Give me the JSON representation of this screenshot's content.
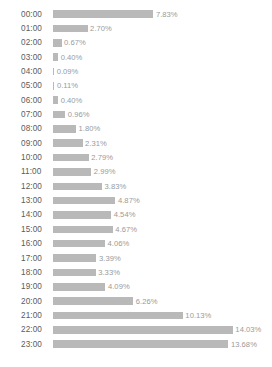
{
  "chart_data": {
    "type": "bar",
    "orientation": "horizontal",
    "title": "",
    "subtitle": "",
    "xlabel": "",
    "ylabel": "",
    "grid": false,
    "legend": null,
    "value_suffix": "%",
    "xlim": [
      0,
      14.03
    ],
    "categories": [
      "00:00",
      "01:00",
      "02:00",
      "03:00",
      "04:00",
      "05:00",
      "06:00",
      "07:00",
      "08:00",
      "09:00",
      "10:00",
      "11:00",
      "12:00",
      "13:00",
      "14:00",
      "15:00",
      "16:00",
      "17:00",
      "18:00",
      "19:00",
      "20:00",
      "21:00",
      "22:00",
      "23:00"
    ],
    "values": [
      7.83,
      2.7,
      0.67,
      0.4,
      0.09,
      0.11,
      0.4,
      0.96,
      1.8,
      2.31,
      2.79,
      2.99,
      3.83,
      4.87,
      4.54,
      4.67,
      4.06,
      3.39,
      3.33,
      4.09,
      6.26,
      10.13,
      14.03,
      13.68
    ],
    "value_labels": [
      "7.83%",
      "2.70%",
      "0.67%",
      "0.40%",
      "0.09%",
      "0.11%",
      "0.40%",
      "0.96%",
      "1.80%",
      "2.31%",
      "2.79%",
      "2.99%",
      "3.83%",
      "4.87%",
      "4.54%",
      "4.67%",
      "4.06%",
      "3.39%",
      "3.33%",
      "4.09%",
      "6.26%",
      "10.13%",
      "14.03%",
      "13.68%"
    ]
  },
  "colors": {
    "bar": "#b9b9b9",
    "category_text": "#5b5b5b",
    "value_text": "#9a9a9a",
    "background": "#ffffff"
  },
  "scale": {
    "px_per_percent": 12.82
  }
}
